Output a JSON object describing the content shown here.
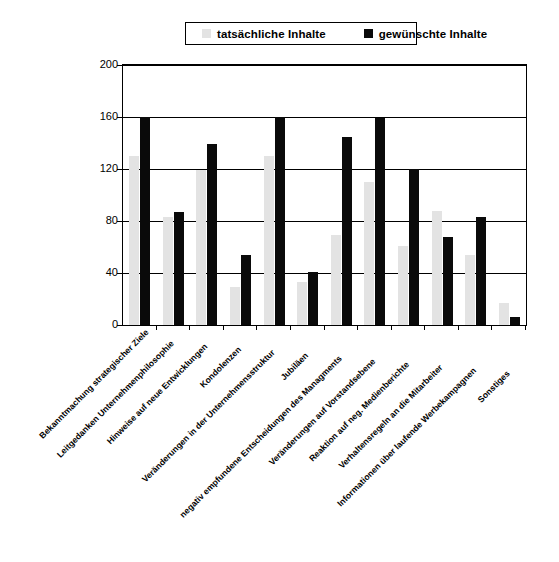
{
  "chart_data": {
    "type": "bar",
    "title": "",
    "subtitle": "",
    "xlabel": "",
    "ylabel": "",
    "ylim": [
      0,
      200
    ],
    "yticks": [
      0,
      40,
      80,
      120,
      160,
      200
    ],
    "grid": true,
    "legend_position": "top",
    "categories": [
      "Bekanntmachung strategischer Ziele",
      "Leitgedanken Unternehmenphilosophie",
      "Hinweise auf neue Entwicklungen",
      "Kondolenzen",
      "Veränderungen in der Unternehmensstruktur",
      "Jubiläen",
      "negativ empfundene Entscheidungen des Managments",
      "Veränderungen auf Vorstandsebene",
      "Reaktion auf neg. Medienberichte",
      "Verhaltensregeln an die Mitarbeiter",
      "Informationen über laufende Werbekampagnen",
      "Sonstiges"
    ],
    "series": [
      {
        "name": "tatsächliche Inhalte",
        "color": "#e3e3e3",
        "values": [
          130,
          83,
          119,
          29,
          130,
          33,
          69,
          110,
          61,
          88,
          54,
          17
        ]
      },
      {
        "name": "gewünschte Inhalte",
        "color": "#0a0a0a",
        "values": [
          160,
          87,
          139,
          54,
          160,
          41,
          145,
          159,
          120,
          68,
          83,
          6
        ]
      }
    ]
  },
  "legend": {
    "entries": [
      {
        "label": "tatsächliche Inhalte",
        "swatch": "legend-swatch-actual"
      },
      {
        "label": "gewünschte Inhalte",
        "swatch": "legend-swatch-desired"
      }
    ]
  }
}
